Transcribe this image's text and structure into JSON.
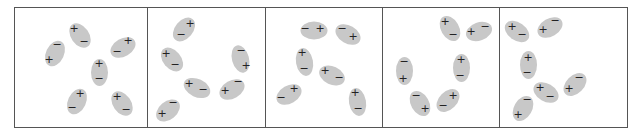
{
  "figure": {
    "colors": {
      "ellipse": "#c8c8c8",
      "border": "#555555",
      "sign": "#222222"
    },
    "signs": {
      "plus": "+",
      "minus": "−"
    },
    "panels": [
      {
        "id": 1,
        "x": 14,
        "w": 133
      },
      {
        "id": 2,
        "x": 147,
        "w": 118
      },
      {
        "id": 3,
        "x": 265,
        "w": 117
      },
      {
        "id": 4,
        "x": 382,
        "w": 117
      },
      {
        "id": 5,
        "x": 499,
        "w": 129
      }
    ],
    "molecules": [
      {
        "panel": 1,
        "cx": 80,
        "cy": 35,
        "w": 18,
        "h": 27,
        "rot": -35,
        "plus": [
          74,
          29
        ],
        "minus": [
          84,
          42
        ]
      },
      {
        "panel": 1,
        "cx": 55,
        "cy": 53,
        "w": 18,
        "h": 27,
        "rot": 25,
        "plus": [
          49,
          60
        ],
        "minus": [
          57,
          45
        ]
      },
      {
        "panel": 1,
        "cx": 123,
        "cy": 47,
        "w": 18,
        "h": 27,
        "rot": 60,
        "plus": [
          128,
          41
        ],
        "minus": [
          117,
          52
        ]
      },
      {
        "panel": 1,
        "cx": 99,
        "cy": 72,
        "w": 17,
        "h": 27,
        "rot": 0,
        "plus": [
          99,
          64
        ],
        "minus": [
          99,
          79
        ]
      },
      {
        "panel": 1,
        "cx": 77,
        "cy": 101,
        "w": 18,
        "h": 27,
        "rot": 25,
        "plus": [
          80,
          94
        ],
        "minus": [
          72,
          108
        ]
      },
      {
        "panel": 1,
        "cx": 122,
        "cy": 103,
        "w": 18,
        "h": 27,
        "rot": -35,
        "plus": [
          117,
          97
        ],
        "minus": [
          126,
          110
        ]
      },
      {
        "panel": 2,
        "cx": 184,
        "cy": 29,
        "w": 18,
        "h": 27,
        "rot": 40,
        "plus": [
          190,
          24
        ],
        "minus": [
          181,
          35
        ]
      },
      {
        "panel": 2,
        "cx": 172,
        "cy": 59,
        "w": 18,
        "h": 27,
        "rot": -40,
        "plus": [
          166,
          54
        ],
        "minus": [
          175,
          65
        ]
      },
      {
        "panel": 2,
        "cx": 240,
        "cy": 59,
        "w": 17,
        "h": 28,
        "rot": -15,
        "plus": [
          246,
          66
        ],
        "minus": [
          241,
          51
        ]
      },
      {
        "panel": 2,
        "cx": 197,
        "cy": 88,
        "w": 18,
        "h": 28,
        "rot": -65,
        "plus": [
          189,
          84
        ],
        "minus": [
          203,
          90
        ]
      },
      {
        "panel": 2,
        "cx": 232,
        "cy": 89,
        "w": 18,
        "h": 27,
        "rot": 60,
        "plus": [
          225,
          91
        ],
        "minus": [
          238,
          82
        ]
      },
      {
        "panel": 2,
        "cx": 168,
        "cy": 110,
        "w": 18,
        "h": 27,
        "rot": 50,
        "plus": [
          162,
          114
        ],
        "minus": [
          173,
          103
        ]
      },
      {
        "panel": 3,
        "cx": 314,
        "cy": 30,
        "w": 18,
        "h": 27,
        "rot": 90,
        "plus": [
          320,
          29
        ],
        "minus": [
          305,
          29
        ]
      },
      {
        "panel": 3,
        "cx": 348,
        "cy": 34,
        "w": 18,
        "h": 27,
        "rot": -60,
        "plus": [
          353,
          37
        ],
        "minus": [
          342,
          29
        ]
      },
      {
        "panel": 3,
        "cx": 304,
        "cy": 62,
        "w": 17,
        "h": 28,
        "rot": -10,
        "plus": [
          302,
          53
        ],
        "minus": [
          304,
          69
        ]
      },
      {
        "panel": 3,
        "cx": 332,
        "cy": 75,
        "w": 18,
        "h": 27,
        "rot": -65,
        "plus": [
          325,
          71
        ],
        "minus": [
          339,
          78
        ]
      },
      {
        "panel": 3,
        "cx": 289,
        "cy": 94,
        "w": 18,
        "h": 27,
        "rot": 60,
        "plus": [
          294,
          89
        ],
        "minus": [
          281,
          98
        ]
      },
      {
        "panel": 3,
        "cx": 357,
        "cy": 102,
        "w": 17,
        "h": 28,
        "rot": -10,
        "plus": [
          355,
          93
        ],
        "minus": [
          358,
          109
        ]
      },
      {
        "panel": 4,
        "cx": 450,
        "cy": 28,
        "w": 18,
        "h": 27,
        "rot": -30,
        "plus": [
          445,
          22
        ],
        "minus": [
          453,
          35
        ]
      },
      {
        "panel": 4,
        "cx": 479,
        "cy": 31,
        "w": 18,
        "h": 27,
        "rot": 70,
        "plus": [
          471,
          32
        ],
        "minus": [
          485,
          27
        ]
      },
      {
        "panel": 4,
        "cx": 404,
        "cy": 71,
        "w": 17,
        "h": 28,
        "rot": 0,
        "plus": [
          403,
          79
        ],
        "minus": [
          404,
          62
        ]
      },
      {
        "panel": 4,
        "cx": 461,
        "cy": 68,
        "w": 17,
        "h": 28,
        "rot": 0,
        "plus": [
          461,
          60
        ],
        "minus": [
          460,
          76
        ]
      },
      {
        "panel": 4,
        "cx": 420,
        "cy": 103,
        "w": 18,
        "h": 27,
        "rot": -30,
        "plus": [
          425,
          109
        ],
        "minus": [
          416,
          96
        ]
      },
      {
        "panel": 4,
        "cx": 448,
        "cy": 100,
        "w": 18,
        "h": 27,
        "rot": 45,
        "plus": [
          453,
          96
        ],
        "minus": [
          443,
          106
        ]
      },
      {
        "panel": 5,
        "cx": 517,
        "cy": 31,
        "w": 18,
        "h": 27,
        "rot": -55,
        "plus": [
          512,
          27
        ],
        "minus": [
          522,
          35
        ]
      },
      {
        "panel": 5,
        "cx": 550,
        "cy": 27,
        "w": 18,
        "h": 27,
        "rot": 60,
        "plus": [
          543,
          30
        ],
        "minus": [
          555,
          21
        ]
      },
      {
        "panel": 5,
        "cx": 528,
        "cy": 65,
        "w": 17,
        "h": 28,
        "rot": 0,
        "plus": [
          528,
          58
        ],
        "minus": [
          527,
          73
        ]
      },
      {
        "panel": 5,
        "cx": 546,
        "cy": 92,
        "w": 18,
        "h": 27,
        "rot": -60,
        "plus": [
          540,
          88
        ],
        "minus": [
          550,
          97
        ]
      },
      {
        "panel": 5,
        "cx": 575,
        "cy": 84,
        "w": 18,
        "h": 27,
        "rot": 45,
        "plus": [
          569,
          89
        ],
        "minus": [
          579,
          78
        ]
      },
      {
        "panel": 5,
        "cx": 523,
        "cy": 108,
        "w": 18,
        "h": 27,
        "rot": 30,
        "plus": [
          518,
          115
        ],
        "minus": [
          527,
          100
        ]
      }
    ]
  }
}
